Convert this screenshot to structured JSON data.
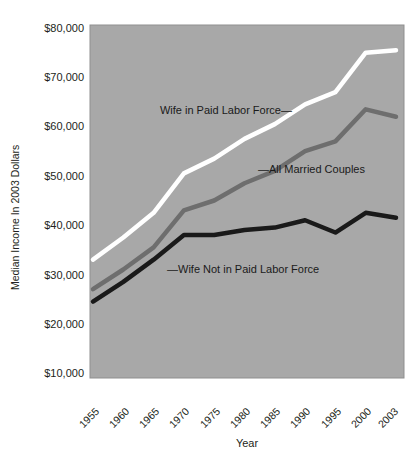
{
  "chart_data": {
    "type": "line",
    "title": "",
    "xlabel": "Year",
    "ylabel": "Median Income In 2003 Dollars",
    "x": [
      1955,
      1960,
      1965,
      1970,
      1975,
      1980,
      1985,
      1990,
      1995,
      2000,
      2003
    ],
    "categories": [
      "1955",
      "1960",
      "1965",
      "1970",
      "1975",
      "1980",
      "1985",
      "1990",
      "1995",
      "2000",
      "2003"
    ],
    "xtick_labels": [
      "1955",
      "1960",
      "1965",
      "1970",
      "1975",
      "1980",
      "1985",
      "1990",
      "1995",
      "2000",
      "2003"
    ],
    "ytick_labels": [
      "$10,000",
      "$20,000",
      "$30,000",
      "$40,000",
      "$50,000",
      "$60,000",
      "$70,000",
      "$80,000"
    ],
    "ytick_values": [
      10000,
      20000,
      30000,
      40000,
      50000,
      60000,
      70000,
      80000
    ],
    "ylim": [
      10000,
      80000
    ],
    "xlim": [
      1955,
      2003
    ],
    "grid": false,
    "legend_position": "inline-annotations",
    "plot_background_color": "#a8a8a8",
    "figure_background_color": "#ffffff",
    "series": [
      {
        "name": "Wife in Paid Labor Force",
        "color": "#ffffff",
        "values": [
          33000,
          37500,
          42500,
          50500,
          53500,
          57500,
          60500,
          64500,
          67000,
          75000,
          75500
        ]
      },
      {
        "name": "All Married Couples",
        "color": "#6e6e6e",
        "values": [
          27000,
          31000,
          35500,
          43000,
          45000,
          48500,
          51000,
          55000,
          57000,
          63500,
          62000
        ]
      },
      {
        "name": "Wife Not in Paid Labor Force",
        "color": "#1a1a1a",
        "values": [
          24500,
          28500,
          33000,
          38000,
          38000,
          39000,
          39500,
          41000,
          38500,
          42500,
          41500
        ]
      }
    ],
    "annotations": [
      {
        "id": "wife-in-paid-labor-force",
        "text": "Wife in Paid Labor Force—",
        "series": "Wife in Paid Labor Force"
      },
      {
        "id": "all-married-couples",
        "text": "—All Married Couples",
        "series": "All Married Couples"
      },
      {
        "id": "wife-not-in-paid-labor-force",
        "text": "—Wife Not in Paid Labor Force",
        "series": "Wife Not in Paid Labor Force"
      }
    ]
  }
}
